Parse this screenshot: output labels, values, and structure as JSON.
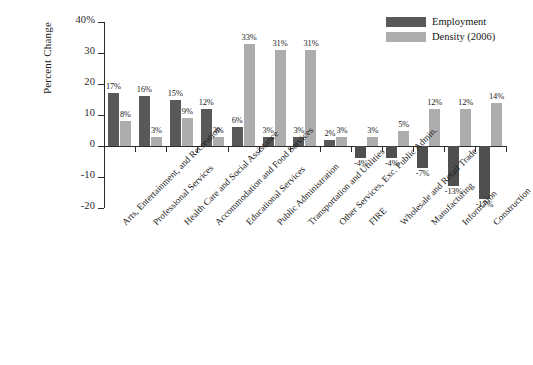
{
  "chart_data": {
    "type": "bar",
    "title": "",
    "xlabel": "",
    "ylabel": "Percent Change",
    "ylim": [
      -20,
      40
    ],
    "yticks": [
      40,
      30,
      20,
      10,
      0,
      -10,
      -20
    ],
    "ytick_labels": [
      "40%",
      "30",
      "20",
      "10",
      "0",
      "-10",
      "-20"
    ],
    "grid": false,
    "legend_position": "top-right",
    "categories": [
      "Arts, Entertainment, and Recreation",
      "Professional Services",
      "Health Care and Social Assistance",
      "Accommodation and Food Services",
      "Educational Services",
      "Public Administration",
      "Transportation and Utilities",
      "Other Services, Exc. Public Admin.",
      "FIRE",
      "Wholesale and Retail Trade",
      "Manufacturing",
      "Information",
      "Construction"
    ],
    "series": [
      {
        "name": "Employment",
        "color": "#595959",
        "values": [
          17,
          16,
          15,
          12,
          6,
          3,
          3,
          2,
          -4,
          -4,
          -7,
          -13,
          -17
        ],
        "labels": [
          "17%",
          "16%",
          "15%",
          "12%",
          "6%",
          "3%",
          "3%",
          "2%",
          "-4%",
          "-4%",
          "-7%",
          "-13%",
          "-17%"
        ]
      },
      {
        "name": "Density (2006)",
        "color": "#adadad",
        "values": [
          8,
          3,
          9,
          3,
          33,
          31,
          31,
          3,
          3,
          5,
          12,
          12,
          14
        ],
        "labels": [
          "8%",
          "3%",
          "9%",
          "3%",
          "33%",
          "31%",
          "31%",
          "3%",
          "3%",
          "5%",
          "12%",
          "12%",
          "14%"
        ]
      }
    ]
  },
  "legend": {
    "items": [
      {
        "label": "Employment",
        "color": "#595959"
      },
      {
        "label": "Density (2006)",
        "color": "#adadad"
      }
    ]
  },
  "caption": ""
}
